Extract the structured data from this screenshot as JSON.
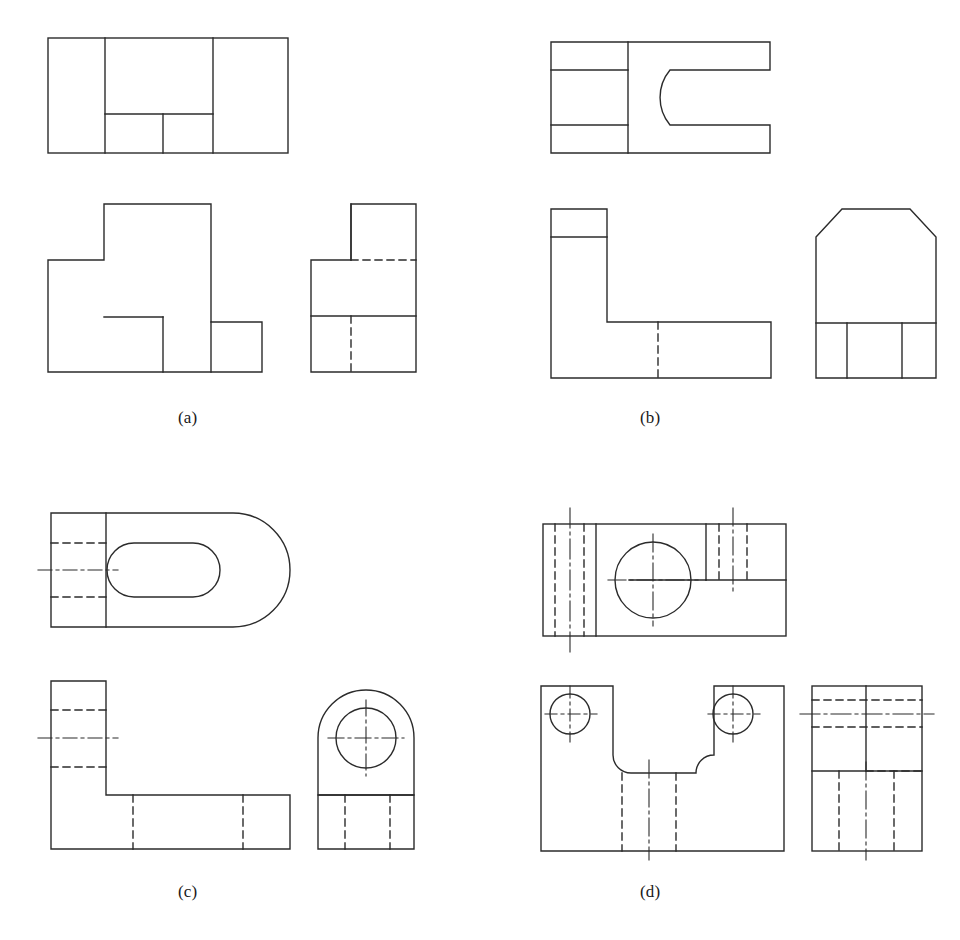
{
  "sheet": {
    "width": 960,
    "height": 940,
    "background": "#ffffff",
    "line_color": "#2b2b2b",
    "visible_line_width": 1.4,
    "hidden_line_width": 1.4,
    "center_line_width": 1.1,
    "hidden_dash": "7,5",
    "center_dash": "14,4,3,4",
    "description": "Engineering orthographic multiview drawing exercise sheet with four labeled problems (a)-(d), each showing top, front and right-side views of a machine part."
  },
  "panels": [
    {
      "id": "a",
      "label": "(a)",
      "label_x": 178,
      "label_y": 408,
      "views": [
        {
          "name": "top-view",
          "features": "Rectangle divided by two vertical lines with an inner notch rectangle at lower middle"
        },
        {
          "name": "front-view",
          "features": "Stepped L / T profile block outline"
        },
        {
          "name": "right-side-view",
          "features": "Stepped profile with horizontal and vertical hidden lines"
        }
      ]
    },
    {
      "id": "b",
      "label": "(b)",
      "label_x": 640,
      "label_y": 408,
      "views": [
        {
          "name": "top-view",
          "features": "Rectangle with left band divided into three, and a U-shaped slot open to the right"
        },
        {
          "name": "front-view",
          "features": "L-shaped profile with a thin top rib and one vertical hidden line"
        },
        {
          "name": "right-side-view",
          "features": "Rectangle with two chamfered top corners and a base band split into three"
        }
      ]
    },
    {
      "id": "c",
      "label": "(c)",
      "label_x": 178,
      "label_y": 882,
      "views": [
        {
          "name": "top-view",
          "features": "Rectangle with semicircular right end, obround slot, two hidden lines and one horizontal center line"
        },
        {
          "name": "front-view",
          "features": "L-shaped profile with two hidden lines, one center line, and two vertical hidden lines in base"
        },
        {
          "name": "right-side-view",
          "features": "Rounded-top plate with a through circle, crossing center lines, and base band with two vertical hidden lines"
        }
      ]
    },
    {
      "id": "d",
      "label": "(d)",
      "label_x": 640,
      "label_y": 882,
      "views": [
        {
          "name": "top-view",
          "features": "Rectangle with a centered circle, two hidden-line bands with vertical center lines on left and right"
        },
        {
          "name": "front-view",
          "features": "Saddle/U-shaped profile with filleted inner corners, two counterbored circles with center lines, and hidden lines in base"
        },
        {
          "name": "right-side-view",
          "features": "Rectangle with horizontal hidden lines, a horizontal center line, and vertical hidden lines in base"
        }
      ]
    }
  ]
}
